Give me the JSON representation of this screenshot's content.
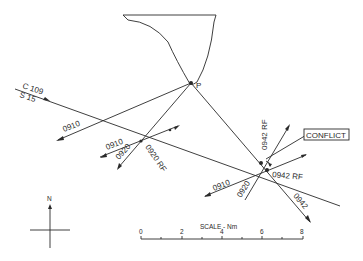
{
  "diagram": {
    "point_label": "P",
    "track_label_top": "C 109",
    "track_label_bottom": "S 15",
    "labels": {
      "a0910_upper": "0910",
      "a0910_lower": "0910",
      "a0920_lower": "0920",
      "a0920_rf": "0920 RF",
      "a0942_rf_upper": "0942 RF",
      "a0942_rf_lower": "0942 RF",
      "a0910_right": "0910",
      "a0920_right": "0920",
      "a0942": "0942",
      "conflict": "CONFLICT"
    },
    "north_label": "N",
    "scale": {
      "title": "SCALE - Nm",
      "ticks": [
        "0",
        "2",
        "4",
        "6",
        "8"
      ]
    }
  }
}
